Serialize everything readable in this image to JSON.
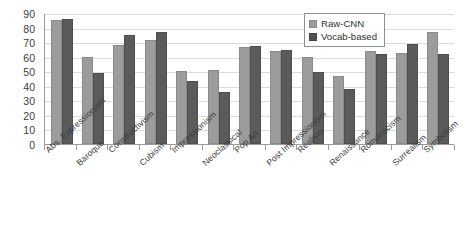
{
  "chart_data": {
    "type": "bar",
    "title": "",
    "xlabel": "",
    "ylabel": "",
    "ylim": [
      0,
      90
    ],
    "ytick_step": 10,
    "yticks": [
      "90",
      "80",
      "70",
      "60",
      "50",
      "40",
      "30",
      "20",
      "10",
      "0"
    ],
    "grid": true,
    "legend_position": "top-right",
    "categories": [
      "Abs. Expressionism",
      "Baroque",
      "Constructivism",
      "Cubism",
      "Impressionism",
      "Neoclassical",
      "Pop Art",
      "Post Impressionism",
      "Realism",
      "Renaissance",
      "Romanticism",
      "Surrealism",
      "Symbolism"
    ],
    "series": [
      {
        "name": "Raw-CNN",
        "color": "#9c9c9c",
        "values": [
          85,
          60,
          68,
          71.5,
          50,
          51,
          66.5,
          64,
          60,
          47,
          64,
          62.5,
          77
        ]
      },
      {
        "name": "Vocab-based",
        "color": "#5b5b5b",
        "values": [
          86,
          49,
          75,
          77,
          43.5,
          36,
          67.5,
          64.5,
          49.5,
          38,
          61.5,
          68.5,
          62
        ]
      }
    ]
  },
  "legend": {
    "items": [
      {
        "label": "Raw-CNN",
        "swatch": "raw"
      },
      {
        "label": "Vocab-based",
        "swatch": "vocab"
      }
    ]
  }
}
